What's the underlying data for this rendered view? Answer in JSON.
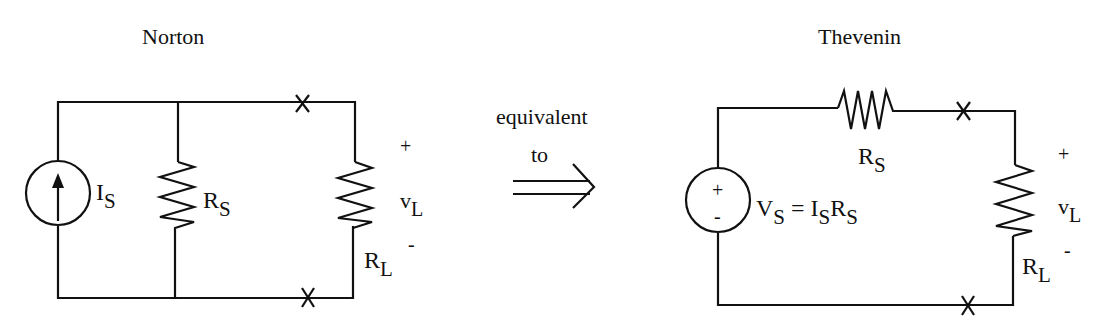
{
  "norton": {
    "title": "Norton",
    "source_label": {
      "main": "I",
      "sub": "S"
    },
    "source_resistor": {
      "main": "R",
      "sub": "S"
    },
    "load_resistor": {
      "main": "R",
      "sub": "L"
    },
    "load_voltage": {
      "main": "v",
      "sub": "L"
    },
    "plus": "+",
    "minus": "-"
  },
  "transition": {
    "line1": "equivalent",
    "line2": "to",
    "arrow": "double-arrow-right"
  },
  "thevenin": {
    "title": "Thevenin",
    "source_polarity_plus": "+",
    "source_polarity_minus": "-",
    "source_equation": {
      "v": "V",
      "v_sub": "S",
      "eq": " = ",
      "i": "I",
      "i_sub": "S",
      "r": "R",
      "r_sub": "S"
    },
    "source_resistor": {
      "main": "R",
      "sub": "S"
    },
    "load_resistor": {
      "main": "R",
      "sub": "L"
    },
    "load_voltage": {
      "main": "v",
      "sub": "L"
    },
    "plus": "+",
    "minus": "-"
  },
  "colors": {
    "ink": "#111111",
    "background": "#ffffff"
  }
}
